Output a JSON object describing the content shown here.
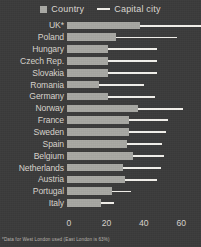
{
  "chart_data": {
    "type": "bar",
    "orientation": "horizontal",
    "title": "",
    "xlabel": "",
    "ylabel": "",
    "xlim": [
      0,
      70
    ],
    "xticks": [
      0,
      20,
      40,
      60
    ],
    "grid": false,
    "legend_position": "top-center",
    "categories": [
      "UK*",
      "Poland",
      "Hungary",
      "Czech Rep.",
      "Slovakia",
      "Romania",
      "Germany",
      "Norway",
      "France",
      "Sweden",
      "Spain",
      "Belgium",
      "Netherlands",
      "Austria",
      "Portugal",
      "Italy"
    ],
    "series": [
      {
        "name": "Country",
        "color": "#a8a8a3",
        "values": [
          39,
          26,
          22,
          22,
          22,
          17,
          22,
          38,
          33,
          33,
          32,
          35,
          30,
          31,
          24,
          18
        ]
      },
      {
        "name": "Capital city",
        "color": "#f2f0eb",
        "values": [
          75,
          59,
          48,
          48,
          48,
          41,
          47,
          62,
          54,
          53,
          51,
          52,
          50,
          48,
          34,
          25
        ]
      }
    ],
    "annotations": [
      "*Data for West London used (East London is 63%)"
    ]
  },
  "legend": {
    "country_label": "Country",
    "capital_label": "Capital city"
  },
  "axis": {
    "tick_labels": [
      "0",
      "20",
      "40",
      "60"
    ]
  },
  "footnote": {
    "text": "*Data for West London used (East London is 63%)"
  }
}
